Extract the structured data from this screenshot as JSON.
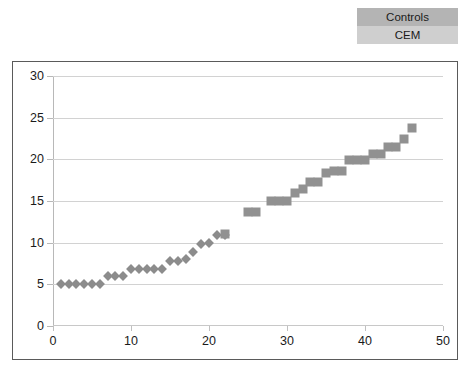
{
  "legend": {
    "position": "top-right",
    "entries": [
      {
        "label": "Controls",
        "color": "#8c8c8c",
        "swatch_bg": "#b4b4b4",
        "marker": "diamond"
      },
      {
        "label": "CEM",
        "color": "#919191",
        "swatch_bg": "#cfcfcf",
        "marker": "square"
      }
    ]
  },
  "chart_data": {
    "type": "scatter",
    "title": "",
    "subtitle": "",
    "xlabel": "",
    "ylabel": "",
    "xlim": [
      0,
      50
    ],
    "ylim": [
      0,
      30
    ],
    "xticks": [
      0,
      10,
      20,
      30,
      40,
      50
    ],
    "yticks": [
      0,
      5,
      10,
      15,
      20,
      25,
      30
    ],
    "grid": "horizontal",
    "legend_position": "top-right",
    "series": [
      {
        "name": "Controls",
        "marker": "diamond",
        "color": "#8c8c8c",
        "points": [
          [
            1,
            5.0
          ],
          [
            2,
            5.0
          ],
          [
            3,
            5.0
          ],
          [
            4,
            5.0
          ],
          [
            5,
            5.0
          ],
          [
            6,
            5.0
          ],
          [
            7,
            6.0
          ],
          [
            8,
            6.0
          ],
          [
            9,
            6.0
          ],
          [
            10,
            6.9
          ],
          [
            11,
            6.9
          ],
          [
            12,
            6.9
          ],
          [
            13,
            6.9
          ],
          [
            14,
            6.9
          ],
          [
            15,
            7.8
          ],
          [
            16,
            7.8
          ],
          [
            17,
            8.1
          ],
          [
            18,
            8.9
          ],
          [
            19,
            9.8
          ],
          [
            20,
            10.0
          ],
          [
            21,
            10.9
          ],
          [
            22,
            10.9
          ]
        ]
      },
      {
        "name": "CEM",
        "marker": "square",
        "color": "#919191",
        "points": [
          [
            22,
            11.0
          ],
          [
            25,
            13.7
          ],
          [
            26,
            13.7
          ],
          [
            28,
            15.0
          ],
          [
            29,
            15.0
          ],
          [
            30,
            15.0
          ],
          [
            31,
            16.0
          ],
          [
            32,
            16.5
          ],
          [
            33,
            17.3
          ],
          [
            34,
            17.3
          ],
          [
            35,
            18.4
          ],
          [
            36,
            18.6
          ],
          [
            37,
            18.6
          ],
          [
            38,
            19.9
          ],
          [
            39,
            19.9
          ],
          [
            40,
            19.9
          ],
          [
            41,
            20.6
          ],
          [
            42,
            20.6
          ],
          [
            43,
            21.5
          ],
          [
            44,
            21.5
          ],
          [
            45,
            22.5
          ],
          [
            46,
            23.8
          ]
        ]
      }
    ]
  }
}
